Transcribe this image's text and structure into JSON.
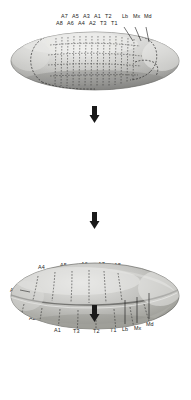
{
  "figure": {
    "organism": "Drosophila melanogaster",
    "background_color": "#ffffff",
    "ink_color": "#1a1a1a"
  },
  "panels": [
    {
      "id": "panel-1",
      "name": "blastoderm-embryo",
      "stage_label": "",
      "labels_top_row": [
        "A7",
        "A5",
        "A3",
        "A1",
        "T2",
        "Lb",
        "Mx",
        "Md"
      ],
      "labels_bottom_row": [
        "A8",
        "A6",
        "A4",
        "A2",
        "T3",
        "T1"
      ],
      "leader_lines": 3,
      "segment_count": 14
    },
    {
      "id": "panel-2",
      "name": "germband-extended-embryo",
      "labels_top": [
        "A4",
        "A5",
        "A6",
        "A7",
        "A8"
      ],
      "labels_left": [
        "A3",
        "A2"
      ],
      "labels_bottom": [
        "A1",
        "T3",
        "T2",
        "T1",
        "Lb",
        "Mx",
        "Md"
      ]
    },
    {
      "id": "panel-3",
      "name": "germband-retracted-embryo",
      "labels_left": [
        "A8",
        "A7",
        "A6"
      ],
      "labels_arc": [
        "A5",
        "A4",
        "A3",
        "A2",
        "A1",
        "T3",
        "T2",
        "T1"
      ]
    },
    {
      "id": "panel-4",
      "name": "adult-fly",
      "labels_top": [
        "A5",
        "A4",
        "A3",
        "A2",
        "A1",
        "T3",
        "T2",
        "T1"
      ],
      "labels_left": [
        "A6",
        "A7",
        "A8"
      ]
    }
  ],
  "arrows": [
    {
      "id": "arrow-1",
      "name": "arrow-panel1-to-panel2",
      "direction": "down"
    },
    {
      "id": "arrow-2",
      "name": "arrow-panel2-to-panel3",
      "direction": "down"
    },
    {
      "id": "arrow-3",
      "name": "arrow-panel3-to-panel4",
      "direction": "down"
    }
  ],
  "segment_glossary": {
    "Md": "mandibular",
    "Mx": "maxillary",
    "Lb": "labial",
    "T1": "thoracic 1",
    "T2": "thoracic 2",
    "T3": "thoracic 3",
    "A1": "abdominal 1",
    "A2": "abdominal 2",
    "A3": "abdominal 3",
    "A4": "abdominal 4",
    "A5": "abdominal 5",
    "A6": "abdominal 6",
    "A7": "abdominal 7",
    "A8": "abdominal 8"
  }
}
